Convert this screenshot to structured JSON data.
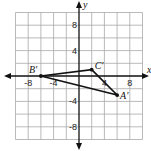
{
  "diagram": {
    "type": "coordinate-plane",
    "axes": {
      "x_label": "x",
      "y_label": "y",
      "range": [
        -10,
        10
      ],
      "grid_step": 2
    },
    "tick_labels": {
      "x": [
        {
          "value": -8,
          "text": "-8"
        },
        {
          "value": -4,
          "text": "-4"
        },
        {
          "value": 4,
          "text": "4"
        },
        {
          "value": 8,
          "text": "8"
        }
      ],
      "y": [
        {
          "value": 8,
          "text": "8"
        },
        {
          "value": 4,
          "text": "4"
        },
        {
          "value": -4,
          "text": "-4"
        },
        {
          "value": -8,
          "text": "-8"
        }
      ]
    },
    "points": [
      {
        "name": "A'",
        "x": 6,
        "y": -3
      },
      {
        "name": "B'",
        "x": -6,
        "y": 0
      },
      {
        "name": "C'",
        "x": 2,
        "y": 1
      }
    ],
    "polygon": [
      "A'",
      "B'",
      "C'"
    ]
  }
}
